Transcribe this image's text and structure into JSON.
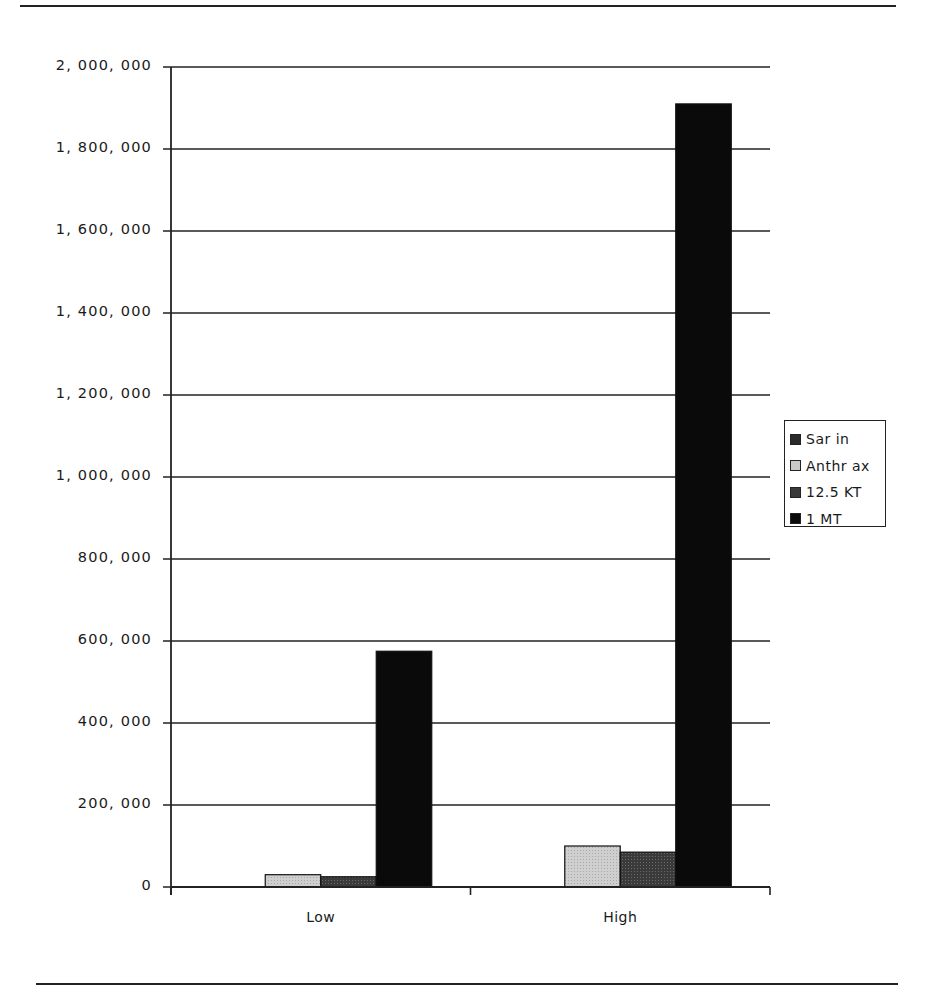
{
  "chart_data": {
    "type": "bar",
    "title": "",
    "xlabel": "",
    "ylabel": "",
    "categories": [
      "Low",
      "High"
    ],
    "series": [
      {
        "name": "Sarin",
        "values": [
          0,
          0
        ],
        "color": "#2a2a2a"
      },
      {
        "name": "Anthrax",
        "values": [
          30000,
          100000
        ],
        "color": "#c8c8c8"
      },
      {
        "name": "12.5 KT",
        "values": [
          25000,
          85000
        ],
        "color": "#3a3a3a"
      },
      {
        "name": "1 MT",
        "values": [
          575000,
          1910000
        ],
        "color": "#0a0a0a"
      }
    ],
    "ylim": [
      0,
      2000000
    ],
    "yticks": [
      "0",
      "200,000",
      "400,000",
      "600,000",
      "800,000",
      "1,000,000",
      "1,200,000",
      "1,400,000",
      "1,600,000",
      "1,800,000",
      "2,000,000"
    ],
    "grid": true,
    "legend_position": "right"
  },
  "legend": {
    "items": [
      {
        "label": "Sar in",
        "color": "#2a2a2a"
      },
      {
        "label": "Anthr ax",
        "color": "#c8c8c8"
      },
      {
        "label": "12.5 KT",
        "color": "#3a3a3a"
      },
      {
        "label": "1 MT",
        "color": "#0a0a0a"
      }
    ]
  },
  "axis": {
    "y_labels": [
      "0",
      "200, 000",
      "400, 000",
      "600, 000",
      "800, 000",
      "1, 000, 000",
      "1, 200, 000",
      "1, 400, 000",
      "1, 600, 000",
      "1, 800, 000",
      "2, 000, 000"
    ],
    "x_labels": [
      "Low",
      "High"
    ]
  }
}
